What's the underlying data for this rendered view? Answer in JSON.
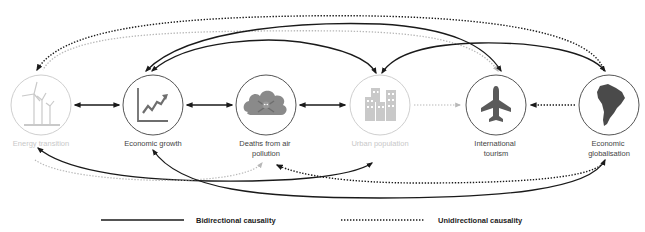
{
  "nodes": [
    {
      "id": "energy",
      "label_lines": [
        "Energy transition"
      ],
      "icon": "wind-turbine-icon",
      "cx": 41,
      "cy": 105,
      "faded": true
    },
    {
      "id": "growth",
      "label_lines": [
        "Economic growth"
      ],
      "icon": "growth-chart-icon",
      "cx": 153,
      "cy": 105,
      "faded": false
    },
    {
      "id": "deaths",
      "label_lines": [
        "Deaths from air",
        "pollution"
      ],
      "icon": "toxic-cloud-icon",
      "cx": 266,
      "cy": 105,
      "faded": false
    },
    {
      "id": "urban",
      "label_lines": [
        "Urban population"
      ],
      "icon": "buildings-icon",
      "cx": 380,
      "cy": 105,
      "faded": true
    },
    {
      "id": "tourism",
      "label_lines": [
        "International",
        "tourism"
      ],
      "icon": "airplane-icon",
      "cx": 496,
      "cy": 105,
      "faded": false
    },
    {
      "id": "globalisation",
      "label_lines": [
        "Economic",
        "globalisation"
      ],
      "icon": "south-america-map-icon",
      "cx": 609,
      "cy": 105,
      "faded": false
    }
  ],
  "edges": [
    {
      "from": "energy",
      "to": "growth",
      "type": "bidirectional",
      "path": "adjacent"
    },
    {
      "from": "growth",
      "to": "deaths",
      "type": "bidirectional",
      "path": "adjacent"
    },
    {
      "from": "deaths",
      "to": "urban",
      "type": "bidirectional",
      "path": "adjacent"
    },
    {
      "from": "urban",
      "to": "tourism",
      "type": "unidirectional",
      "path": "adjacent",
      "faded": true
    },
    {
      "from": "globalisation",
      "to": "tourism",
      "type": "unidirectional",
      "path": "adjacent"
    },
    {
      "from": "globalisation",
      "to": "energy",
      "type": "unidirectional",
      "path": "top-arc"
    },
    {
      "from": "tourism",
      "to": "energy",
      "type": "unidirectional",
      "path": "top-arc",
      "faded": true
    },
    {
      "from": "growth",
      "to": "tourism",
      "type": "bidirectional",
      "path": "top-arc"
    },
    {
      "from": "growth",
      "to": "urban",
      "type": "bidirectional",
      "path": "top-arc"
    },
    {
      "from": "urban",
      "to": "globalisation",
      "type": "bidirectional",
      "path": "top-arc"
    },
    {
      "from": "energy",
      "to": "urban",
      "type": "bidirectional",
      "path": "bottom-arc"
    },
    {
      "from": "energy",
      "to": "deaths",
      "type": "unidirectional",
      "path": "bottom-arc",
      "faded": true
    },
    {
      "from": "growth",
      "to": "globalisation",
      "type": "bidirectional",
      "path": "bottom-arc"
    },
    {
      "from": "globalisation",
      "to": "deaths",
      "type": "unidirectional",
      "path": "bottom-arc"
    }
  ],
  "legend": {
    "bidirectional_label": "Bidirectional causality",
    "unidirectional_label": "Unidirectional causality"
  },
  "colors": {
    "line": "#1a1a1a",
    "faded_line": "#b8b8b8",
    "circle": "#555555",
    "faded_circle": "#cfcfcf",
    "icon": "#6e6e6e",
    "faded_icon": "#c9c9c9"
  }
}
